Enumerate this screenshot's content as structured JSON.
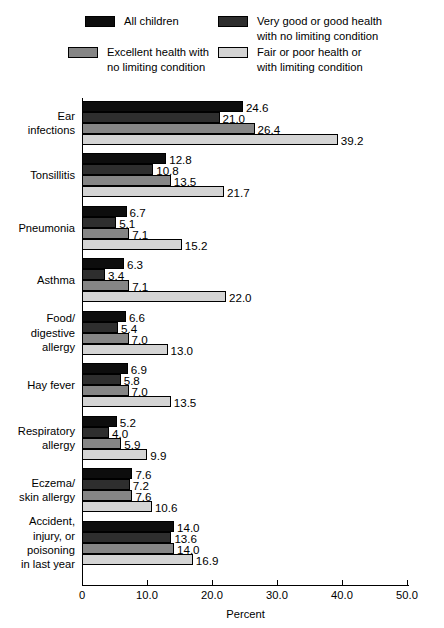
{
  "legend": {
    "entries": [
      {
        "label": "All children",
        "color": "#0d0d0d",
        "swatch_name": "legend-swatch-all-children"
      },
      {
        "label": "Very good or good health\nwith no limiting condition",
        "color": "#2e2e2e",
        "swatch_name": "legend-swatch-very-good-or-good-health"
      },
      {
        "label": "Excellent health with\nno limiting condition",
        "color": "#858585",
        "swatch_name": "legend-swatch-excellent-health"
      },
      {
        "label": "Fair or poor health or\nwith limiting condition",
        "color": "#d4d4d4",
        "swatch_name": "legend-swatch-fair-or-poor-health"
      }
    ]
  },
  "chart_data": {
    "type": "bar",
    "orientation": "horizontal",
    "title": "",
    "xlabel": "Percent",
    "ylabel": "",
    "xlim": [
      0,
      50
    ],
    "xticks": [
      0,
      10.0,
      20.0,
      30.0,
      40.0,
      50.0
    ],
    "xtick_labels": [
      "0",
      "10.0",
      "20.0",
      "30.0",
      "40.0",
      "50.0"
    ],
    "grid": false,
    "legend_position": "top",
    "series": [
      {
        "name": "All children",
        "color": "#0d0d0d",
        "values": [
          24.6,
          12.8,
          6.7,
          6.3,
          6.6,
          6.9,
          5.2,
          7.6,
          14.0
        ]
      },
      {
        "name": "Very good or good health with no limiting condition",
        "color": "#2e2e2e",
        "values": [
          21.0,
          10.8,
          5.1,
          3.4,
          5.4,
          5.8,
          4.0,
          7.2,
          13.6
        ]
      },
      {
        "name": "Excellent health with no limiting condition",
        "color": "#858585",
        "values": [
          26.4,
          13.5,
          7.1,
          7.1,
          7.0,
          7.0,
          5.9,
          7.6,
          14.0
        ]
      },
      {
        "name": "Fair or poor health or with limiting condition",
        "color": "#d4d4d4",
        "values": [
          39.2,
          21.7,
          15.2,
          22.0,
          13.0,
          13.5,
          9.9,
          10.6,
          16.9
        ]
      }
    ],
    "categories": [
      "Ear\ninfections",
      "Tonsillitis",
      "Pneumonia",
      "Asthma",
      "Food/\ndigestive\nallergy",
      "Hay fever",
      "Respiratory\nallergy",
      "Eczema/\nskin allergy",
      "Accident,\ninjury, or\npoisoning\nin last year"
    ],
    "value_labels": [
      [
        "24.6",
        "21.0",
        "26.4",
        "39.2"
      ],
      [
        "12.8",
        "10.8",
        "13.5",
        "21.7"
      ],
      [
        "6.7",
        "5.1",
        "7.1",
        "15.2"
      ],
      [
        "6.3",
        "3.4",
        "7.1",
        "22.0"
      ],
      [
        "6.6",
        "5.4",
        "7.0",
        "13.0"
      ],
      [
        "6.9",
        "5.8",
        "7.0",
        "13.5"
      ],
      [
        "5.2",
        "4.0",
        "5.9",
        "9.9"
      ],
      [
        "7.6",
        "7.2",
        "7.6",
        "10.6"
      ],
      [
        "14.0",
        "13.6",
        "14.0",
        "16.9"
      ]
    ]
  }
}
